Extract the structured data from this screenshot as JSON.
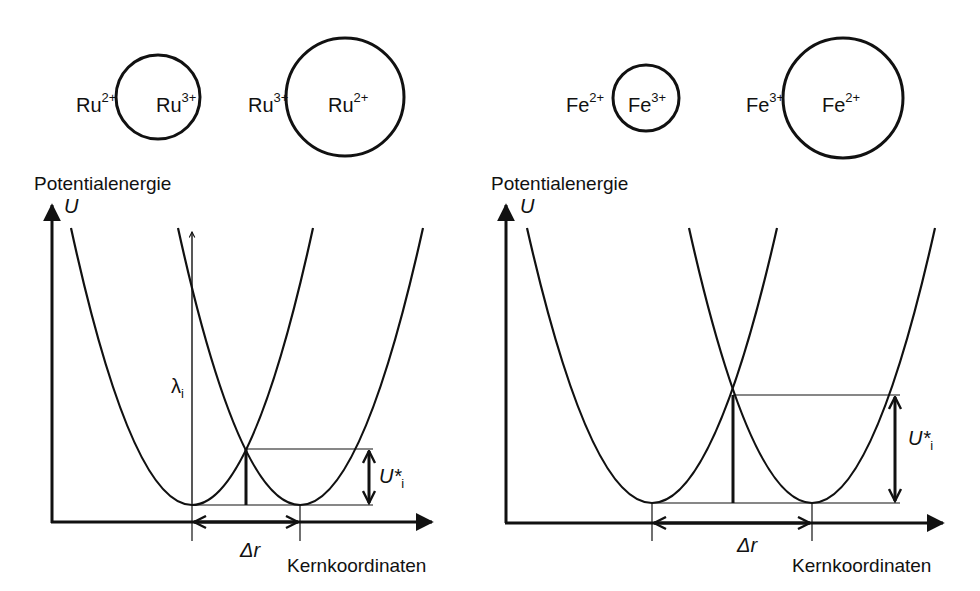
{
  "figure": {
    "panels": [
      {
        "id": "ru",
        "ions": [
          {
            "outer": "Ru",
            "outer_charge": "2+",
            "inner": "Ru",
            "inner_charge": "3+",
            "circle": "small"
          },
          {
            "outer": "Ru",
            "outer_charge": "3+",
            "inner": "Ru",
            "inner_charge": "2+",
            "circle": "large"
          }
        ],
        "y_axis_title": "Potentialenergie",
        "y_axis_symbol": "U",
        "x_axis_title": "Kernkoordinaten",
        "reorganization_label": "λ",
        "reorganization_sub": "i",
        "activation_label": "U*",
        "activation_sub": "i",
        "displacement_label": "Δr",
        "note": "small Δr → low crossing point"
      },
      {
        "id": "fe",
        "ions": [
          {
            "outer": "Fe",
            "outer_charge": "2+",
            "inner": "Fe",
            "inner_charge": "3+",
            "circle": "small"
          },
          {
            "outer": "Fe",
            "outer_charge": "3+",
            "inner": "Fe",
            "inner_charge": "2+",
            "circle": "large"
          }
        ],
        "y_axis_title": "Potentialenergie",
        "y_axis_symbol": "U",
        "x_axis_title": "Kernkoordinaten",
        "activation_label": "U*",
        "activation_sub": "i",
        "displacement_label": "Δr",
        "note": "large Δr → high crossing point"
      }
    ],
    "colors": {
      "ink": "#111111",
      "background": "#ffffff"
    }
  }
}
